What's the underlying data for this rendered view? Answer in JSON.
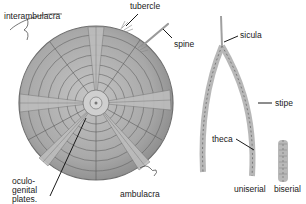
{
  "figure": {
    "echinoid": {
      "labels": {
        "interambulacra": "interambulacra",
        "tubercle": "tubercle",
        "spine": "spine",
        "oculogenital_line1": "oculo-",
        "oculogenital_line2": "genital",
        "oculogenital_line3": "plates.",
        "ambulacra": "ambulacra"
      }
    },
    "graptolite": {
      "labels": {
        "sicula": "sicula",
        "stipe": "stipe",
        "theca": "theca",
        "uniserial": "uniserial",
        "biserial": "biserial"
      }
    },
    "colors": {
      "test_fill": "#a9a9a9",
      "test_edge": "#6e6e6e",
      "plate_lines": "#5e5e5e",
      "graptolite": "#b8b8b8",
      "label_text": "#1a1a1a",
      "background": "#ffffff"
    }
  }
}
